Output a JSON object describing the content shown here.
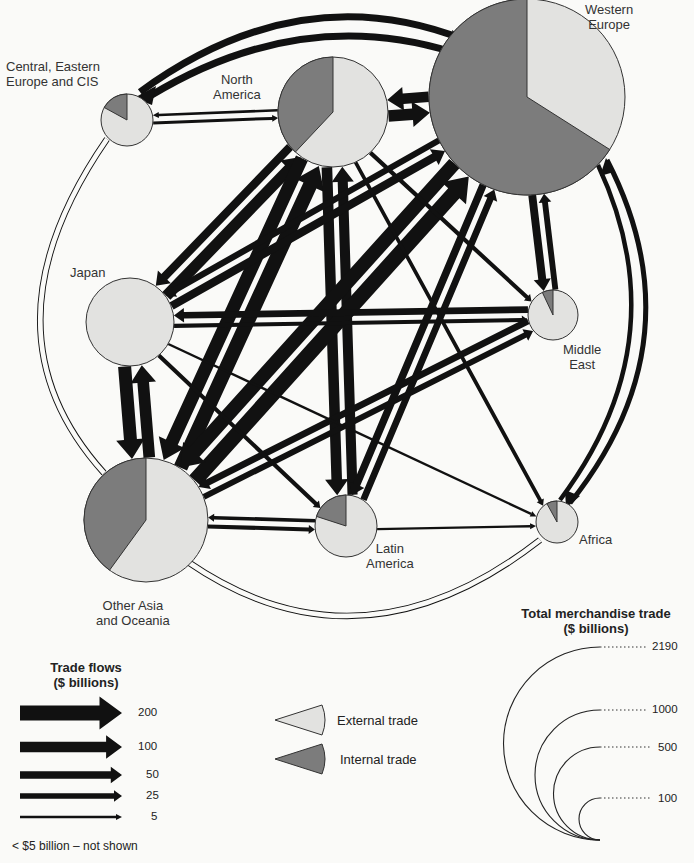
{
  "colors": {
    "external": "#e2e2e0",
    "internal": "#7c7c7c",
    "ink": "#111111",
    "background": "#fafaf8"
  },
  "regions": [
    {
      "id": "we",
      "label": "Western\nEurope",
      "cx": 527,
      "cy": 97,
      "r": 98,
      "internal_share": 0.66,
      "lx": 585,
      "ly": 2,
      "align": "center"
    },
    {
      "id": "na",
      "label": "North\nAmerica",
      "cx": 333,
      "cy": 112,
      "r": 55,
      "internal_share": 0.38,
      "lx": 215,
      "ly": 72,
      "align": "center"
    },
    {
      "id": "cee",
      "label": "Central, Eastern\nEurope and CIS",
      "cx": 127,
      "cy": 120,
      "r": 26,
      "internal_share": 0.17,
      "lx": 6,
      "ly": 59,
      "align": "left"
    },
    {
      "id": "jp",
      "label": "Japan",
      "cx": 130,
      "cy": 322,
      "r": 44,
      "internal_share": 0.0,
      "lx": 70,
      "ly": 265,
      "align": "left"
    },
    {
      "id": "me",
      "label": "Middle\nEast",
      "cx": 553,
      "cy": 315,
      "r": 25,
      "internal_share": 0.07,
      "lx": 563,
      "ly": 342,
      "align": "center"
    },
    {
      "id": "af",
      "label": "Africa",
      "cx": 557,
      "cy": 522,
      "r": 21,
      "internal_share": 0.08,
      "lx": 579,
      "ly": 532,
      "align": "left"
    },
    {
      "id": "la",
      "label": "Latin\nAmerica",
      "cx": 346,
      "cy": 526,
      "r": 31,
      "internal_share": 0.2,
      "lx": 367,
      "ly": 540,
      "align": "center"
    },
    {
      "id": "oa",
      "label": "Other Asia\nand Oceania",
      "cx": 146,
      "cy": 520,
      "r": 62,
      "internal_share": 0.4,
      "lx": 94,
      "ly": 598,
      "align": "center"
    }
  ],
  "flows": [
    {
      "from": "na",
      "to": "we",
      "value": 120
    },
    {
      "from": "we",
      "to": "na",
      "value": 100
    },
    {
      "from": "we",
      "to": "cee",
      "value": 80
    },
    {
      "from": "cee",
      "to": "we",
      "value": 75
    },
    {
      "from": "cee",
      "to": "na",
      "value": 8
    },
    {
      "from": "na",
      "to": "cee",
      "value": 6
    },
    {
      "from": "jp",
      "to": "na",
      "value": 110
    },
    {
      "from": "na",
      "to": "jp",
      "value": 60
    },
    {
      "from": "oa",
      "to": "na",
      "value": 180
    },
    {
      "from": "na",
      "to": "oa",
      "value": 150
    },
    {
      "from": "la",
      "to": "na",
      "value": 90
    },
    {
      "from": "na",
      "to": "la",
      "value": 100
    },
    {
      "from": "oa",
      "to": "we",
      "value": 200
    },
    {
      "from": "we",
      "to": "oa",
      "value": 170
    },
    {
      "from": "jp",
      "to": "we",
      "value": 60
    },
    {
      "from": "we",
      "to": "jp",
      "value": 35
    },
    {
      "from": "jp",
      "to": "oa",
      "value": 150
    },
    {
      "from": "oa",
      "to": "jp",
      "value": 120
    },
    {
      "from": "la",
      "to": "we",
      "value": 40
    },
    {
      "from": "we",
      "to": "la",
      "value": 50
    },
    {
      "from": "me",
      "to": "we",
      "value": 30
    },
    {
      "from": "we",
      "to": "me",
      "value": 55
    },
    {
      "from": "af",
      "to": "we",
      "value": 55
    },
    {
      "from": "we",
      "to": "af",
      "value": 60
    },
    {
      "from": "me",
      "to": "jp",
      "value": 40
    },
    {
      "from": "jp",
      "to": "me",
      "value": 15
    },
    {
      "from": "me",
      "to": "oa",
      "value": 40
    },
    {
      "from": "oa",
      "to": "me",
      "value": 30
    },
    {
      "from": "oa",
      "to": "la",
      "value": 15
    },
    {
      "from": "la",
      "to": "oa",
      "value": 12
    },
    {
      "from": "na",
      "to": "me",
      "value": 15
    },
    {
      "from": "na",
      "to": "af",
      "value": 12
    },
    {
      "from": "jp",
      "to": "la",
      "value": 15
    },
    {
      "from": "jp",
      "to": "af",
      "value": 5
    },
    {
      "from": "oa",
      "to": "af",
      "value": 10
    },
    {
      "from": "cee",
      "to": "oa",
      "value": 10
    },
    {
      "from": "oa",
      "to": "cee",
      "value": 8
    },
    {
      "from": "af",
      "to": "oa",
      "value": 10
    },
    {
      "from": "la",
      "to": "af",
      "value": 5
    }
  ],
  "legend_flows": {
    "title": "Trade flows\n($ billions)",
    "items": [
      {
        "value": 200,
        "label": "200"
      },
      {
        "value": 100,
        "label": "100"
      },
      {
        "value": 50,
        "label": "50"
      },
      {
        "value": 25,
        "label": "25"
      },
      {
        "value": 5,
        "label": "5"
      }
    ],
    "note": "< $5 billion – not shown"
  },
  "legend_pie": {
    "external_label": "External trade",
    "internal_label": "Internal trade"
  },
  "legend_size": {
    "title": "Total merchandise trade\n($ billions)",
    "items": [
      {
        "value": 2190,
        "label": "2190"
      },
      {
        "value": 1000,
        "label": "1000"
      },
      {
        "value": 500,
        "label": "500"
      },
      {
        "value": 100,
        "label": "100"
      }
    ]
  }
}
